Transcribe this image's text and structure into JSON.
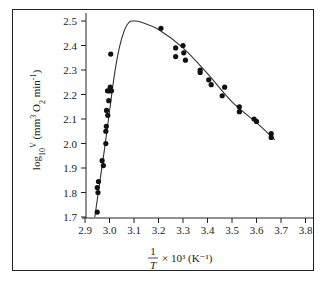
{
  "chart_data": {
    "type": "scatter",
    "title": "",
    "xlabel": "1/T × 10³ (K⁻¹)",
    "xlabel_parts": {
      "numerator": "1",
      "denominator": "T",
      "suffix": "× 10³ (K⁻¹)"
    },
    "ylabel": "log₁₀V (mm³ O₂ min⁻¹)",
    "xlim": [
      2.9,
      3.8
    ],
    "ylim": [
      1.7,
      2.5
    ],
    "xticks": [
      "2.9",
      "3.0",
      "3.1",
      "3.2",
      "3.3",
      "3.4",
      "3.5",
      "3.6",
      "3.7",
      "3.8"
    ],
    "yticks": [
      "1.7",
      "1.8",
      "1.9",
      "2.0",
      "2.1",
      "2.2",
      "2.3",
      "2.4",
      "2.5"
    ],
    "grid": false,
    "legend": null,
    "series": [
      {
        "name": "measurements",
        "marker": "filled-circle",
        "points": [
          [
            2.95,
            1.72
          ],
          [
            2.95,
            1.82
          ],
          [
            2.953,
            1.8
          ],
          [
            2.955,
            1.845
          ],
          [
            2.97,
            1.93
          ],
          [
            2.975,
            1.91
          ],
          [
            2.985,
            2.0
          ],
          [
            2.985,
            2.05
          ],
          [
            2.987,
            2.07
          ],
          [
            2.988,
            2.135
          ],
          [
            2.993,
            2.115
          ],
          [
            2.997,
            2.175
          ],
          [
            2.992,
            2.215
          ],
          [
            3.0,
            2.215
          ],
          [
            3.003,
            2.23
          ],
          [
            3.008,
            2.215
          ],
          [
            3.005,
            2.365
          ],
          [
            3.21,
            2.47
          ],
          [
            3.27,
            2.39
          ],
          [
            3.27,
            2.355
          ],
          [
            3.3,
            2.4
          ],
          [
            3.303,
            2.37
          ],
          [
            3.31,
            2.34
          ],
          [
            3.37,
            2.3
          ],
          [
            3.37,
            2.29
          ],
          [
            3.405,
            2.26
          ],
          [
            3.415,
            2.24
          ],
          [
            3.46,
            2.195
          ],
          [
            3.47,
            2.23
          ],
          [
            3.53,
            2.15
          ],
          [
            3.53,
            2.13
          ],
          [
            3.59,
            2.1
          ],
          [
            3.6,
            2.09
          ],
          [
            3.66,
            2.04
          ],
          [
            3.66,
            2.025
          ]
        ]
      },
      {
        "name": "fitted-curve",
        "marker": "line",
        "points": [
          [
            2.94,
            1.7
          ],
          [
            2.96,
            1.84
          ],
          [
            2.98,
            1.98
          ],
          [
            3.0,
            2.13
          ],
          [
            3.02,
            2.28
          ],
          [
            3.04,
            2.39
          ],
          [
            3.06,
            2.46
          ],
          [
            3.08,
            2.495
          ],
          [
            3.1,
            2.5
          ],
          [
            3.13,
            2.495
          ],
          [
            3.2,
            2.465
          ],
          [
            3.3,
            2.39
          ],
          [
            3.4,
            2.285
          ],
          [
            3.5,
            2.17
          ],
          [
            3.6,
            2.085
          ],
          [
            3.675,
            2.015
          ]
        ]
      }
    ]
  }
}
